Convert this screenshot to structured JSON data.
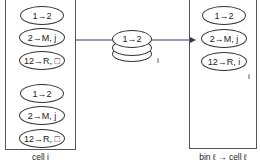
{
  "left_cell": {
    "label": "cell i",
    "groups": [
      [
        "1→2",
        "2→M, j",
        "12→R, □"
      ],
      [
        "1→2",
        "2→M, j",
        "12→R, □"
      ]
    ]
  },
  "message": {
    "top_label": "1→2",
    "index_label": "i"
  },
  "right_cell": {
    "label": "bin ℓ → cell ℓ",
    "items": [
      "1→2",
      "2→M, j",
      "12→R, i"
    ],
    "index_label": "i"
  },
  "colors": {
    "arrow": "#2e3a5c",
    "stroke": "#333333"
  }
}
